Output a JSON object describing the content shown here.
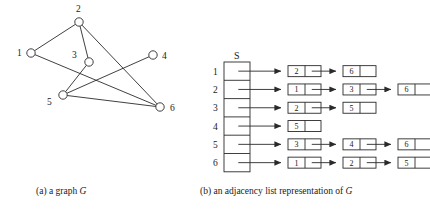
{
  "figure": {
    "caption_a_prefix": "(a) a graph ",
    "caption_a_italic": "G",
    "caption_b_prefix": "(b) an adjacency list representation of ",
    "caption_b_italic": "G",
    "array_header": "S"
  },
  "graph": {
    "title": "a graph G",
    "vertices": [
      {
        "id": "1",
        "label": "1",
        "cx": 31,
        "cy": 53,
        "r": 4.2,
        "label_x": 17,
        "label_y": 56
      },
      {
        "id": "2",
        "label": "2",
        "cx": 79,
        "cy": 22,
        "r": 4.2,
        "label_x": 76,
        "label_y": 12
      },
      {
        "id": "3",
        "label": "3",
        "cx": 89,
        "cy": 62,
        "r": 4.2,
        "label_x": 72,
        "label_y": 58
      },
      {
        "id": "4",
        "label": "4",
        "cx": 153,
        "cy": 55,
        "r": 4.2,
        "label_x": 162,
        "label_y": 59
      },
      {
        "id": "5",
        "label": "5",
        "cx": 63,
        "cy": 95,
        "r": 4.2,
        "label_x": 47,
        "label_y": 105
      },
      {
        "id": "6",
        "label": "6",
        "cx": 160,
        "cy": 107,
        "r": 4.2,
        "label_x": 170,
        "label_y": 111
      }
    ],
    "edges": [
      {
        "from": "1",
        "to": "2"
      },
      {
        "from": "1",
        "to": "6"
      },
      {
        "from": "2",
        "to": "3"
      },
      {
        "from": "2",
        "to": "6"
      },
      {
        "from": "3",
        "to": "5"
      },
      {
        "from": "4",
        "to": "5"
      },
      {
        "from": "5",
        "to": "6"
      }
    ],
    "stroke": "#2a2a2a"
  },
  "adjacency": {
    "array_label": "S",
    "rows": [
      {
        "index": "1",
        "nodes": [
          "2",
          "6"
        ]
      },
      {
        "index": "2",
        "nodes": [
          "1",
          "3",
          "6"
        ]
      },
      {
        "index": "3",
        "nodes": [
          "2",
          "5"
        ]
      },
      {
        "index": "4",
        "nodes": [
          "5"
        ]
      },
      {
        "index": "5",
        "nodes": [
          "3",
          "4",
          "6"
        ]
      },
      {
        "index": "6",
        "nodes": [
          "1",
          "2",
          "5"
        ]
      }
    ],
    "array_x": 224,
    "array_y": 62,
    "array_width": 26,
    "row_height": 18.3,
    "first_node_x": 288,
    "node_width": 33,
    "node_height": 11,
    "node_gap": 22,
    "value_cell_width": 17,
    "stroke": "#2a2a2a"
  }
}
